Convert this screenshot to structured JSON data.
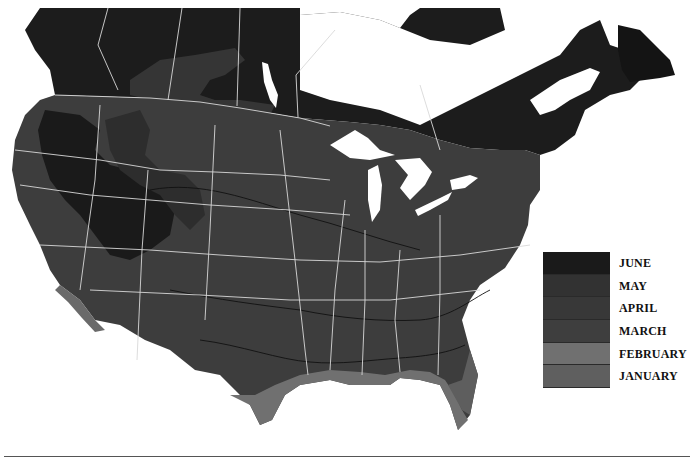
{
  "map": {
    "description": "Grayscale map of the United States and southern Canada shaded by month",
    "regions": [
      "Canada",
      "United States"
    ],
    "lakes": [
      "Great Lakes",
      "Lake Winnipeg",
      "Hudson Bay coast",
      "Gulf of St. Lawrence"
    ]
  },
  "legend": {
    "items": [
      {
        "label": "JUNE",
        "color": "#1a1a1a"
      },
      {
        "label": "MAY",
        "color": "#323232"
      },
      {
        "label": "APRIL",
        "color": "#383838"
      },
      {
        "label": "MARCH",
        "color": "#3e3e3e"
      },
      {
        "label": "FEBRUARY",
        "color": "#707070"
      },
      {
        "label": "JANUARY",
        "color": "#5f5f5f"
      }
    ]
  }
}
